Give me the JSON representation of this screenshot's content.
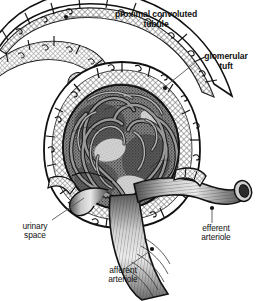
{
  "figure": {
    "background_color": "#ffffff",
    "ink_color": "#111111",
    "width": 257,
    "height": 301,
    "style": "engraved pen-and-ink anatomical illustration, grayscale"
  },
  "labels": [
    {
      "id": "proximal-convoluted-tubule",
      "text": "proximal convoluted\ntubule",
      "weight": "bold",
      "anchor_dot": [
        66,
        17
      ],
      "leader_to": [
        100,
        17
      ]
    },
    {
      "id": "glomerular-tuft",
      "text": "glomerular\ntuft",
      "weight": "bold",
      "anchor_dot": [
        165,
        88
      ],
      "leader_to": [
        198,
        62
      ]
    },
    {
      "id": "urinary-space",
      "text": "urinary\nspace",
      "weight": "plain",
      "anchor_dot": [
        86,
        196
      ],
      "leader_to": [
        48,
        220
      ]
    },
    {
      "id": "efferent-arteriole",
      "text": "efferent\narteriole",
      "weight": "plain",
      "anchor_dot": [
        212,
        208
      ],
      "leader_to": [
        212,
        224
      ]
    },
    {
      "id": "afferent-arteriole",
      "text": "afferent\narteriole",
      "weight": "plain",
      "anchor_dot": [
        152,
        249
      ],
      "leader_to": [
        124,
        270
      ]
    }
  ],
  "structures": {
    "proximal_convoluted_tubule": "cuboidal epithelial cells lining a cross-hatched tubular lumen arcing across the top of the figure",
    "bowmans_capsule": "outer epithelial wall of flattened cells enclosing the corpuscle",
    "urinary_space": "cross-hatched band between the capsule wall and the glomerular tuft",
    "glomerular_tuft": "dense tangle of looping glomerular capillaries filling the corpuscle",
    "afferent_arteriole": "thick ribbed vessel entering from bottom centre",
    "efferent_arteriole": "ribbed vessel exiting to the right with an open cut lumen"
  }
}
